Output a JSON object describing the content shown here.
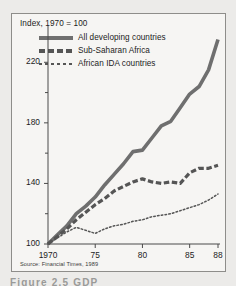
{
  "figure": {
    "title": "Index, 1970 = 100",
    "source": "Source: Financial Times, 1989",
    "caption": "Figure 2.5   GDP"
  },
  "legend": {
    "items": [
      {
        "label": "All developing countries",
        "style": "solid",
        "color": "#6f6f6f"
      },
      {
        "label": "Sub-Saharan Africa",
        "style": "dashed",
        "color": "#555555"
      },
      {
        "label": "African IDA countries",
        "style": "dotted",
        "color": "#555555"
      }
    ]
  },
  "axes": {
    "y_ticks": [
      "220",
      "180",
      "140",
      "100"
    ],
    "x_ticks": [
      "1970",
      "75",
      "80",
      "85",
      "88"
    ]
  },
  "chart_data": {
    "type": "line",
    "title": "Index, 1970 = 100",
    "xlabel": "",
    "ylabel": "Index, 1970 = 100",
    "xlim": [
      1970,
      1988
    ],
    "ylim": [
      100,
      240
    ],
    "ytick_values": [
      100,
      140,
      180,
      220
    ],
    "ytick_minor": [
      120,
      160,
      200
    ],
    "xtick_values": [
      1970,
      1975,
      1980,
      1985,
      1988
    ],
    "grid": false,
    "legend_position": "upper-left-inside",
    "source": "Source: Financial Times, 1989",
    "x": [
      1970,
      1971,
      1972,
      1973,
      1974,
      1975,
      1976,
      1977,
      1978,
      1979,
      1980,
      1981,
      1982,
      1983,
      1984,
      1985,
      1986,
      1987,
      1988
    ],
    "series": [
      {
        "name": "All developing countries",
        "style": "solid",
        "color": "#6f6f6f",
        "values": [
          100,
          106,
          112,
          120,
          125,
          131,
          139,
          146,
          153,
          161,
          162,
          170,
          178,
          181,
          190,
          199,
          204,
          215,
          235
        ]
      },
      {
        "name": "Sub-Saharan Africa",
        "style": "dashed",
        "color": "#555555",
        "values": [
          100,
          105,
          110,
          116,
          121,
          126,
          130,
          135,
          138,
          141,
          143,
          141,
          140,
          141,
          140,
          147,
          150,
          150,
          152
        ]
      },
      {
        "name": "African IDA countries",
        "style": "dotted",
        "color": "#555555",
        "values": [
          100,
          104,
          108,
          111,
          109,
          107,
          110,
          112,
          113,
          115,
          116,
          118,
          119,
          120,
          122,
          124,
          126,
          129,
          133
        ]
      }
    ]
  }
}
